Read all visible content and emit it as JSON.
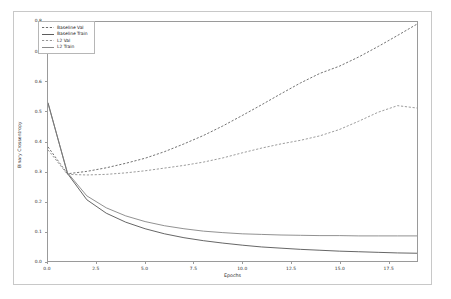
{
  "chart_data": {
    "type": "line",
    "title": "",
    "xlabel": "Epochs",
    "ylabel": "Binary Crossentropy",
    "xlim": [
      0,
      19
    ],
    "ylim": [
      0.0,
      0.8
    ],
    "xticks": [
      "0.0",
      "2.5",
      "5.0",
      "7.5",
      "10.0",
      "12.5",
      "15.0",
      "17.5"
    ],
    "xtick_values": [
      0.0,
      2.5,
      5.0,
      7.5,
      10.0,
      12.5,
      15.0,
      17.5
    ],
    "yticks": [
      "0.0",
      "0.1",
      "0.2",
      "0.3",
      "0.4",
      "0.5",
      "0.6",
      "0.7",
      "0.8"
    ],
    "ytick_values": [
      0.0,
      0.1,
      0.2,
      0.3,
      0.4,
      0.5,
      0.6,
      0.7,
      0.8
    ],
    "grid": false,
    "legend_position": "upper left",
    "x": [
      0,
      1,
      2,
      3,
      4,
      5,
      6,
      7,
      8,
      9,
      10,
      11,
      12,
      13,
      14,
      15,
      16,
      17,
      18,
      19
    ],
    "series": [
      {
        "name": "Baseline Val",
        "style": "dashed",
        "color": "#5a5a5a",
        "values": [
          0.382,
          0.292,
          0.3,
          0.312,
          0.327,
          0.344,
          0.366,
          0.392,
          0.42,
          0.452,
          0.487,
          0.523,
          0.56,
          0.596,
          0.628,
          0.652,
          0.683,
          0.718,
          0.755,
          0.793
        ]
      },
      {
        "name": "Baseline Train",
        "style": "solid",
        "color": "#4a4a4a",
        "values": [
          0.53,
          0.293,
          0.205,
          0.16,
          0.13,
          0.108,
          0.091,
          0.078,
          0.068,
          0.06,
          0.053,
          0.047,
          0.043,
          0.039,
          0.036,
          0.033,
          0.031,
          0.029,
          0.027,
          0.026
        ]
      },
      {
        "name": "L2 Val",
        "style": "dashed",
        "color": "#8a8a8a",
        "values": [
          0.372,
          0.29,
          0.288,
          0.29,
          0.295,
          0.302,
          0.311,
          0.32,
          0.331,
          0.345,
          0.362,
          0.378,
          0.392,
          0.404,
          0.419,
          0.44,
          0.468,
          0.498,
          0.52,
          0.512
        ]
      },
      {
        "name": "L2 Train",
        "style": "solid",
        "color": "#7d7d7d",
        "values": [
          0.527,
          0.296,
          0.218,
          0.178,
          0.151,
          0.132,
          0.118,
          0.108,
          0.1,
          0.095,
          0.091,
          0.089,
          0.087,
          0.086,
          0.085,
          0.085,
          0.084,
          0.084,
          0.084,
          0.084
        ]
      }
    ]
  },
  "legend": {
    "items": [
      {
        "label": "Baseline Val"
      },
      {
        "label": "Baseline Train"
      },
      {
        "label": "L2 Val"
      },
      {
        "label": "L2 Train"
      }
    ]
  }
}
